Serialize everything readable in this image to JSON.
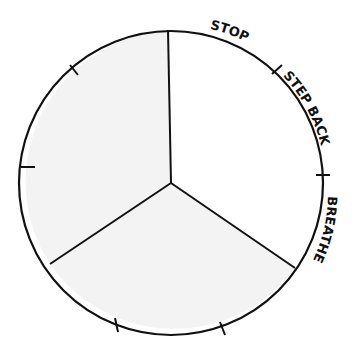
{
  "diagram": {
    "type": "segmented-circle",
    "segments": 3,
    "shaded_segments": [
      "left",
      "bottom"
    ],
    "colors": {
      "stroke": "#111111",
      "shade": "#f3f3f3",
      "background": "#ffffff"
    },
    "labels": {
      "stop": "STOP",
      "step_back": "STEP BACK",
      "breathe": "BREATHE"
    }
  }
}
